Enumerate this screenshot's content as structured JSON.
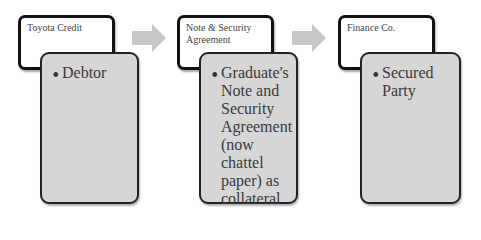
{
  "diagram": {
    "type": "process-flow",
    "accent_colors": {
      "top_box_fill": "#ffffff",
      "bottom_box_fill": "#d6d6d6",
      "arrow": "#c8c8c8",
      "border": "#111111"
    },
    "steps": [
      {
        "title": "Toyota Credit",
        "detail": "Debtor"
      },
      {
        "title": "Note & Security Agreement",
        "detail": "Graduate's Note and Security Agreement (now chattel paper) as collateral"
      },
      {
        "title": "Finance Co.",
        "detail": "Secured Party"
      }
    ],
    "connectors": [
      {
        "icon": "right-arrow-icon",
        "from": 0,
        "to": 1
      },
      {
        "icon": "right-arrow-icon",
        "from": 1,
        "to": 2
      }
    ]
  }
}
